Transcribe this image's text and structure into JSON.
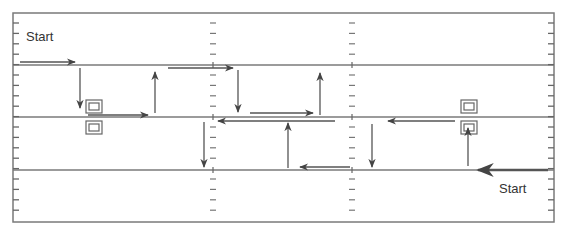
{
  "diagram": {
    "type": "path-flow",
    "colors": {
      "line": "#7a7a7a",
      "arrow": "#444444",
      "frame": "#7a7a7a",
      "box": "#666666"
    },
    "frame": {
      "x": 13,
      "y": 13,
      "w": 541,
      "h": 209
    },
    "lanes": [
      65,
      117,
      170
    ],
    "tick_columns": [
      213,
      352
    ],
    "labels": [
      {
        "id": "start-top-left",
        "text": "Start",
        "x": 26,
        "y": 29
      },
      {
        "id": "start-bottom-right",
        "text": "Start",
        "x": 499,
        "y": 181
      }
    ],
    "boxes": [
      {
        "id": "box-left-top",
        "x": 86,
        "y": 100
      },
      {
        "id": "box-left-bottom",
        "x": 86,
        "y": 121
      },
      {
        "id": "box-right-top",
        "x": 461,
        "y": 100
      },
      {
        "id": "box-right-bottom",
        "x": 461,
        "y": 121
      }
    ],
    "arrows": [
      {
        "from": [
          20,
          62
        ],
        "to": [
          75,
          62
        ]
      },
      {
        "from": [
          80,
          68
        ],
        "to": [
          80,
          108
        ]
      },
      {
        "from": [
          88,
          115
        ],
        "to": [
          148,
          115
        ]
      },
      {
        "from": [
          155,
          113
        ],
        "to": [
          155,
          72
        ]
      },
      {
        "from": [
          168,
          68
        ],
        "to": [
          233,
          68
        ]
      },
      {
        "from": [
          238,
          70
        ],
        "to": [
          238,
          112
        ]
      },
      {
        "from": [
          250,
          113
        ],
        "to": [
          313,
          113
        ]
      },
      {
        "from": [
          320,
          115
        ],
        "to": [
          320,
          73
        ]
      },
      {
        "from": [
          335,
          121
        ],
        "to": [
          218,
          121
        ]
      },
      {
        "from": [
          204,
          122
        ],
        "to": [
          204,
          167
        ]
      },
      {
        "from": [
          288,
          168
        ],
        "to": [
          288,
          123
        ]
      },
      {
        "from": [
          350,
          167
        ],
        "to": [
          300,
          167
        ]
      },
      {
        "from": [
          372,
          124
        ],
        "to": [
          372,
          167
        ]
      },
      {
        "from": [
          455,
          121
        ],
        "to": [
          388,
          121
        ]
      },
      {
        "from": [
          468,
          166
        ],
        "to": [
          468,
          128
        ]
      },
      {
        "from": [
          548,
          170
        ],
        "to": [
          478,
          170
        ],
        "thick": true
      }
    ]
  }
}
